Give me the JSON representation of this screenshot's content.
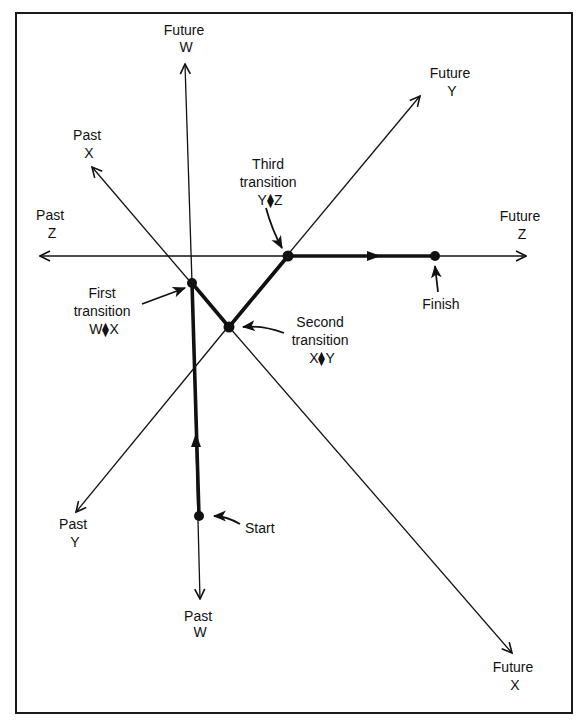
{
  "diagram": {
    "type": "state-transition-path",
    "colors": {
      "ink": "#111111",
      "background": "#ffffff"
    },
    "axes": [
      {
        "id": "W",
        "future_label": [
          "Future",
          "W"
        ],
        "past_label": [
          "Past",
          "W"
        ]
      },
      {
        "id": "X",
        "future_label": [
          "Future",
          "X"
        ],
        "past_label": [
          "Past",
          "X"
        ]
      },
      {
        "id": "Y",
        "future_label": [
          "Future",
          "Y"
        ],
        "past_label": [
          "Past",
          "Y"
        ]
      },
      {
        "id": "Z",
        "future_label": [
          "Future",
          "Z"
        ],
        "past_label": [
          "Past",
          "Z"
        ]
      }
    ],
    "labels": {
      "future_w": {
        "line1": "Future",
        "line2": "W"
      },
      "past_w": {
        "line1": "Past",
        "line2": "W"
      },
      "future_x": {
        "line1": "Future",
        "line2": "X"
      },
      "past_x": {
        "line1": "Past",
        "line2": "X"
      },
      "future_y": {
        "line1": "Future",
        "line2": "Y"
      },
      "past_y": {
        "line1": "Past",
        "line2": "Y"
      },
      "future_z": {
        "line1": "Future",
        "line2": "Z"
      },
      "past_z": {
        "line1": "Past",
        "line2": "Z"
      }
    },
    "points": {
      "start": {
        "label": "Start"
      },
      "first": {
        "line1": "First",
        "line2": "transition",
        "line3": "W⧫X"
      },
      "second": {
        "line1": "Second",
        "line2": "transition",
        "line3": "X⧫Y"
      },
      "third": {
        "line1": "Third",
        "line2": "transition",
        "line3": "Y⧫Z"
      },
      "finish": {
        "label": "Finish"
      }
    },
    "path_sequence": [
      "Start",
      "First transition W⧫X",
      "Second transition X⧫Y",
      "Third transition Y⧫Z",
      "Finish"
    ]
  }
}
